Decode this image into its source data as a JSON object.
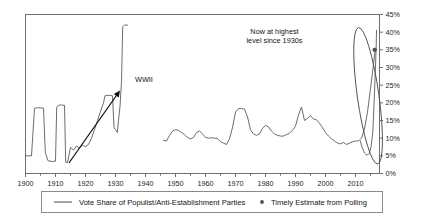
{
  "chart_data": {
    "type": "line",
    "title": "",
    "xlabel": "",
    "ylabel": "",
    "xlim": [
      1900,
      2018
    ],
    "ylim": [
      0,
      0.45
    ],
    "grid": false,
    "legend_position": "bottom",
    "y_tick_labels": [
      "0%",
      "5%",
      "10%",
      "15%",
      "20%",
      "25%",
      "30%",
      "35%",
      "40%",
      "45%"
    ],
    "y_tick_values": [
      0,
      5,
      10,
      15,
      20,
      25,
      30,
      35,
      40,
      45
    ],
    "x_tick_labels": [
      "1900",
      "1910",
      "1920",
      "1930",
      "1940",
      "1950",
      "1960",
      "1970",
      "1980",
      "1990",
      "2000",
      "2010"
    ],
    "x_tick_values": [
      1900,
      1910,
      1920,
      1930,
      1940,
      1950,
      1960,
      1970,
      1980,
      1990,
      2000,
      2010
    ],
    "series": [
      {
        "name": "Vote Share of Populist/Anti-Establishment Parties",
        "type": "line",
        "color": "#5b5b5b",
        "segments": [
          {
            "name": "pre-war",
            "points": [
              [
                1900,
                5.0
              ],
              [
                1902,
                5.0
              ],
              [
                1903,
                18.5
              ],
              [
                1904,
                18.6
              ],
              [
                1905,
                18.6
              ],
              [
                1906,
                18.5
              ],
              [
                1906.6,
                6.0
              ],
              [
                1907.5,
                3.6
              ],
              [
                1909,
                3.4
              ],
              [
                1910,
                3.5
              ],
              [
                1910.4,
                18.7
              ],
              [
                1911,
                19.3
              ],
              [
                1912,
                19.4
              ],
              [
                1913,
                19.3
              ],
              [
                1913.4,
                3.2
              ],
              [
                1914,
                3.1
              ],
              [
                1915,
                7.4
              ],
              [
                1916,
                6.6
              ],
              [
                1917,
                7.8
              ],
              [
                1918,
                7.2
              ],
              [
                1919,
                8.0
              ],
              [
                1920,
                7.6
              ],
              [
                1921,
                8.2
              ],
              [
                1922,
                10.0
              ],
              [
                1923,
                12.4
              ],
              [
                1924,
                15.0
              ],
              [
                1925,
                17.6
              ],
              [
                1926,
                20.0
              ],
              [
                1926.5,
                22.0
              ],
              [
                1927,
                22.1
              ],
              [
                1928,
                22.1
              ],
              [
                1929,
                22.0
              ],
              [
                1929.5,
                13.0
              ],
              [
                1930,
                12.4
              ],
              [
                1930.6,
                11.6
              ],
              [
                1931,
                15.0
              ],
              [
                1931.5,
                19.0
              ],
              [
                1932,
                26.0
              ],
              [
                1932.4,
                41.5
              ],
              [
                1933,
                42.0
              ],
              [
                1934,
                42.0
              ]
            ]
          },
          {
            "name": "post-war",
            "points": [
              [
                1946,
                9.4
              ],
              [
                1947,
                9.2
              ],
              [
                1948,
                10.8
              ],
              [
                1949,
                12.0
              ],
              [
                1950,
                12.4
              ],
              [
                1951,
                12.2
              ],
              [
                1952,
                11.6
              ],
              [
                1953,
                11.0
              ],
              [
                1954,
                10.2
              ],
              [
                1955,
                9.8
              ],
              [
                1956,
                10.2
              ],
              [
                1957,
                11.6
              ],
              [
                1958,
                12.0
              ],
              [
                1959,
                11.2
              ],
              [
                1960,
                10.2
              ],
              [
                1961,
                10.0
              ],
              [
                1962,
                10.1
              ],
              [
                1963,
                10.0
              ],
              [
                1964,
                9.9
              ],
              [
                1965,
                9.0
              ],
              [
                1966,
                8.6
              ],
              [
                1967,
                8.2
              ],
              [
                1968,
                9.8
              ],
              [
                1969,
                13.0
              ],
              [
                1970,
                17.4
              ],
              [
                1971,
                18.4
              ],
              [
                1972,
                18.4
              ],
              [
                1973,
                18.2
              ],
              [
                1974,
                16.0
              ],
              [
                1975,
                12.4
              ],
              [
                1976,
                11.2
              ],
              [
                1977,
                10.8
              ],
              [
                1978,
                11.2
              ],
              [
                1979,
                12.8
              ],
              [
                1980,
                13.6
              ],
              [
                1981,
                13.2
              ],
              [
                1982,
                12.0
              ],
              [
                1983,
                11.2
              ],
              [
                1984,
                10.8
              ],
              [
                1985,
                10.6
              ],
              [
                1986,
                10.6
              ],
              [
                1987,
                11.0
              ],
              [
                1988,
                11.4
              ],
              [
                1989,
                12.2
              ],
              [
                1990,
                13.4
              ],
              [
                1991,
                16.6
              ],
              [
                1992,
                18.8
              ],
              [
                1993,
                15.0
              ],
              [
                1994,
                15.6
              ],
              [
                1995,
                16.4
              ],
              [
                1996,
                15.4
              ],
              [
                1997,
                15.2
              ],
              [
                1998,
                14.2
              ],
              [
                1999,
                13.0
              ],
              [
                2000,
                11.6
              ],
              [
                2001,
                10.6
              ],
              [
                2002,
                9.8
              ],
              [
                2003,
                9.2
              ],
              [
                2004,
                8.6
              ],
              [
                2005,
                8.4
              ],
              [
                2006,
                8.8
              ],
              [
                2007,
                8.2
              ],
              [
                2008,
                8.6
              ],
              [
                2009,
                9.0
              ],
              [
                2010,
                9.2
              ],
              [
                2011,
                9.2
              ],
              [
                2012,
                10.0
              ],
              [
                2013,
                12.6
              ],
              [
                2014,
                17.4
              ],
              [
                2015,
                24.0
              ],
              [
                2016,
                31.0
              ],
              [
                2016.6,
                35.5
              ]
            ]
          },
          {
            "name": "dip-branch",
            "points": [
              [
                2011.6,
                9.2
              ],
              [
                2012.2,
                7.4
              ],
              [
                2013,
                5.8
              ],
              [
                2013.8,
                5.2
              ],
              [
                2014.6,
                5.6
              ],
              [
                2015.2,
                7.6
              ],
              [
                2015.8,
                12.0
              ],
              [
                2016.2,
                20.0
              ],
              [
                2016.6,
                29.0
              ],
              [
                2016.9,
                36.0
              ],
              [
                2017,
                40.5
              ]
            ]
          }
        ]
      },
      {
        "name": "Timely Estimate from Polling",
        "type": "scatter",
        "color": "#4f4f4f",
        "points": [
          [
            2016.4,
            35.0
          ]
        ]
      }
    ],
    "annotations": [
      {
        "id": "wwii-label",
        "text": "WWII",
        "x": 1936.5,
        "y": 26.0
      },
      {
        "id": "now-highest-label",
        "text_lines": [
          "Now at highest",
          "level since 1930s"
        ],
        "x": 1983,
        "y": 39.5
      },
      {
        "id": "rising-trend-arrow",
        "type": "arrow",
        "from": [
          1914.5,
          3.0
        ],
        "to": [
          1931.5,
          23.5
        ]
      },
      {
        "id": "highlight-ellipse",
        "type": "ellipse",
        "center_x": 2014.2,
        "center_y": 22.0,
        "rx_years": 3.6,
        "ry_pct": 19.5,
        "rotation_deg": -8
      }
    ]
  },
  "legend": {
    "items": [
      {
        "label": "Vote Share of Populist/Anti-Establishment Parties",
        "marker": "line-swatch",
        "color": "#5b5b5b"
      },
      {
        "label": "Timely Estimate from Polling",
        "marker": "dot-swatch",
        "color": "#4f4f4f"
      }
    ]
  }
}
